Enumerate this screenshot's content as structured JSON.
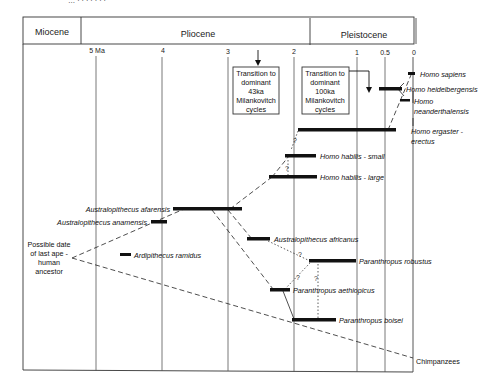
{
  "header_cutoff": "… · · · · · · ·",
  "epochs": [
    {
      "label": "Miocene"
    },
    {
      "label": "Pliocene"
    },
    {
      "label": "Pleistocene"
    }
  ],
  "time_axis": {
    "ticks": [
      {
        "label": "5 Ma",
        "value": 5
      },
      {
        "label": "4",
        "value": 4
      },
      {
        "label": "3",
        "value": 3
      },
      {
        "label": "2",
        "value": 2
      },
      {
        "label": "1",
        "value": 1
      },
      {
        "label": "0.5",
        "value": 0.5
      },
      {
        "label": "0",
        "value": 0
      }
    ]
  },
  "annotations": {
    "milankovitch_43ka": [
      "Transition to",
      "dominant",
      "43ka",
      "Milankovitch",
      "cycles"
    ],
    "milankovitch_100ka": [
      "Transition to",
      "dominant",
      "100ka",
      "Milankovitch",
      "cycles"
    ],
    "ancestor": [
      "Possible date",
      "of last ape -",
      "human",
      "ancestor"
    ],
    "question_mark": "?"
  },
  "species": [
    {
      "name": "Homo sapiens",
      "start_ma": 0.15,
      "end_ma": 0.05
    },
    {
      "name": "Homo heidelbergensis",
      "start_ma": 0.6,
      "end_ma": 0.25
    },
    {
      "name": "Homo neanderthalensis",
      "start_ma": 0.23,
      "end_ma": 0.03
    },
    {
      "name": "Homo ergaster - erectus",
      "label_line1": "Homo ergaster -",
      "label_line2": "erectus",
      "start_ma": 1.9,
      "end_ma": 0.3
    },
    {
      "name": "Homo habilis - small",
      "start_ma": 2.1,
      "end_ma": 1.6
    },
    {
      "name": "Homo habilis - large",
      "start_ma": 2.4,
      "end_ma": 1.6
    },
    {
      "name": "Australopithecus afarensis",
      "start_ma": 3.9,
      "end_ma": 2.8
    },
    {
      "name": "Australopithecus anamensis",
      "start_ma": 4.2,
      "end_ma": 3.9
    },
    {
      "name": "Ardipithecus ramidus",
      "start_ma": 4.5,
      "end_ma": 4.3
    },
    {
      "name": "Australopithecus africanus",
      "start_ma": 2.8,
      "end_ma": 2.4
    },
    {
      "name": "Paranthropus robustus",
      "start_ma": 1.8,
      "end_ma": 1.0
    },
    {
      "name": "Paranthropus aethiopicus",
      "start_ma": 2.4,
      "end_ma": 2.1
    },
    {
      "name": "Paranthropus boisei",
      "start_ma": 2.1,
      "end_ma": 1.3
    },
    {
      "name": "Chimpanzees"
    }
  ],
  "labels": {
    "sapiens": "Homo  sapiens",
    "heidelbergensis": "Homo   heidelbergensis",
    "neander_1": "Homo",
    "neander_2": "neanderthalensis",
    "ergaster_1": "Homo ergaster  -",
    "ergaster_2": "erectus",
    "habilis_small": "Homo  habilis  -  small",
    "habilis_large": "Homo  habilis  -  large",
    "afarensis": "Australopithecus   afarensis",
    "anamensis": "Australopithecus   anamensis",
    "ramidus": "Ardipithecus    ramidus",
    "africanus": "Australopithecus   africanus",
    "robustus": "Paranthropus   robustus",
    "aethiopicus": "Paranthropus    aethiopicus",
    "boisei": "Paranthropus    boisei",
    "chimpanzees": "Chimpanzees"
  }
}
